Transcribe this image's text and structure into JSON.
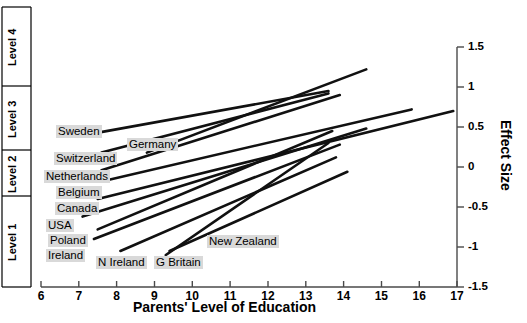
{
  "chart_data": {
    "type": "line",
    "title": "",
    "xlabel": "Parents' Level of Education",
    "ylabel": "Effect Size",
    "xlim": [
      6,
      17
    ],
    "ylim": [
      -1.5,
      1.5
    ],
    "grid": false,
    "legend": "none",
    "xticks": [
      "6",
      "7",
      "8",
      "9",
      "10",
      "11",
      "12",
      "13",
      "14",
      "15",
      "16",
      "17"
    ],
    "yticks": [
      "1.5",
      "1",
      "0.5",
      "0",
      "-0.5",
      "-1",
      "-1.5"
    ],
    "left_axis_label": "Level",
    "left_bands": [
      {
        "label": "Level 4",
        "top_effect": 1.5,
        "bottom_effect": 1.05
      },
      {
        "label": "Level 3",
        "top_effect": 1.05,
        "bottom_effect": 0.25
      },
      {
        "label": "Level 2",
        "top_effect": 0.25,
        "bottom_effect": -0.3
      },
      {
        "label": "Level 1",
        "top_effect": -0.3,
        "bottom_effect": -1.5
      }
    ],
    "series": [
      {
        "name": "Sweden",
        "x": [
          7.4,
          13.6
        ],
        "y": [
          0.42,
          0.95
        ]
      },
      {
        "name": "Germany",
        "x": [
          8.8,
          14.6
        ],
        "y": [
          0.18,
          1.22
        ]
      },
      {
        "name": "Switzerland",
        "x": [
          7.6,
          13.6
        ],
        "y": [
          0.18,
          0.92
        ]
      },
      {
        "name": "Netherlands",
        "x": [
          7.6,
          13.9
        ],
        "y": [
          -0.04,
          0.9
        ]
      },
      {
        "name": "Belgium",
        "x": [
          7.6,
          15.8
        ],
        "y": [
          -0.18,
          0.72
        ]
      },
      {
        "name": "Canada",
        "x": [
          7.5,
          16.9
        ],
        "y": [
          -0.4,
          0.7
        ]
      },
      {
        "name": "USA",
        "x": [
          7.1,
          14.6
        ],
        "y": [
          -0.62,
          0.48
        ]
      },
      {
        "name": "Poland",
        "x": [
          7.5,
          13.7
        ],
        "y": [
          -0.78,
          0.45
        ]
      },
      {
        "name": "Ireland",
        "x": [
          7.4,
          13.9
        ],
        "y": [
          -0.9,
          0.28
        ]
      },
      {
        "name": "N Ireland",
        "x": [
          8.1,
          13.8
        ],
        "y": [
          -1.05,
          0.12
        ]
      },
      {
        "name": "G Britain",
        "x": [
          9.3,
          13.6
        ],
        "y": [
          -1.1,
          0.3
        ]
      },
      {
        "name": "New Zealand",
        "x": [
          9.4,
          14.1
        ],
        "y": [
          -1.05,
          -0.06
        ]
      }
    ],
    "country_labels": [
      {
        "name": "Sweden",
        "x_px": 56,
        "y_px": 125
      },
      {
        "name": "Germany",
        "x_px": 127,
        "y_px": 138
      },
      {
        "name": "Switzerland",
        "x_px": 54,
        "y_px": 152
      },
      {
        "name": "Netherlands",
        "x_px": 44,
        "y_px": 170
      },
      {
        "name": "Belgium",
        "x_px": 56,
        "y_px": 186
      },
      {
        "name": "Canada",
        "x_px": 55,
        "y_px": 202
      },
      {
        "name": "USA",
        "x_px": 46,
        "y_px": 219
      },
      {
        "name": "Poland",
        "x_px": 48,
        "y_px": 234
      },
      {
        "name": "Ireland",
        "x_px": 46,
        "y_px": 249
      },
      {
        "name": "N Ireland",
        "x_px": 96,
        "y_px": 256
      },
      {
        "name": "G Britain",
        "x_px": 154,
        "y_px": 256
      },
      {
        "name": "New Zealand",
        "x_px": 207,
        "y_px": 235
      }
    ]
  }
}
